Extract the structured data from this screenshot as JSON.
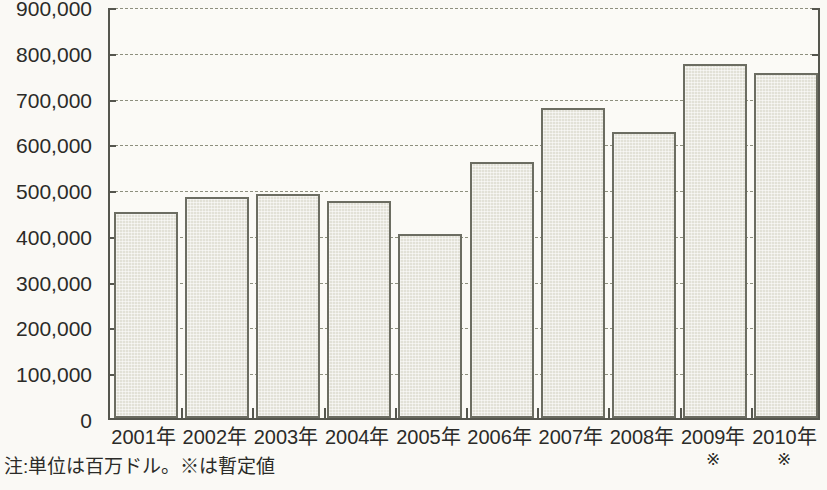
{
  "chart_data": {
    "type": "bar",
    "title": "",
    "subtitle": "",
    "xlabel": "",
    "ylabel": "",
    "categories": [
      "2001年",
      "2002年",
      "2003年",
      "2004年",
      "2005年",
      "2006年",
      "2007年",
      "2008年",
      "2009年",
      "2010年"
    ],
    "category_marks": [
      "",
      "",
      "",
      "",
      "",
      "",
      "",
      "",
      "※",
      "※"
    ],
    "values": [
      450000,
      482000,
      490000,
      473000,
      401000,
      560000,
      678000,
      624000,
      773000,
      754000
    ],
    "series": [
      {
        "name": "",
        "values": [
          450000,
          482000,
          490000,
          473000,
          401000,
          560000,
          678000,
          624000,
          773000,
          754000
        ]
      }
    ],
    "ylim": [
      0,
      900000
    ],
    "ytick_values": [
      0,
      100000,
      200000,
      300000,
      400000,
      500000,
      600000,
      700000,
      800000,
      900000
    ],
    "ytick_labels": [
      "0",
      "100,000",
      "200,000",
      "300,000",
      "400,000",
      "500,000",
      "600,000",
      "700,000",
      "800,000",
      "900,000"
    ],
    "grid": true,
    "grid_style": "dashed-horizontal",
    "legend": false,
    "legend_position": "none",
    "bar_fill_color": "#e2e1d7",
    "bar_border_color": "#6c6d62",
    "axis_color": "#55564e",
    "grid_color": "#8d8f7e",
    "background_color": "#fbfaf6",
    "annotations": [
      "注:単位は百万ドル。※は暫定値"
    ]
  },
  "footnote": {
    "text": "注:単位は百万ドル。※は暫定値"
  }
}
